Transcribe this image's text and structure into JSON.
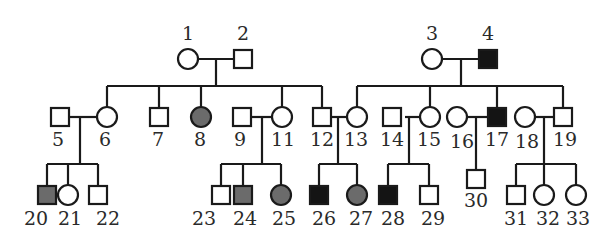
{
  "diagram": {
    "type": "pedigree",
    "colors": {
      "line": "#1a1a1a",
      "unaffected_fill": "#ffffff",
      "affected_dark": "#141414",
      "affected_gray": "#6b6b6b"
    },
    "individuals": [
      {
        "id": "1",
        "sex": "female",
        "status": "unaffected",
        "gen": 1
      },
      {
        "id": "2",
        "sex": "male",
        "status": "unaffected",
        "gen": 1
      },
      {
        "id": "3",
        "sex": "female",
        "status": "unaffected",
        "gen": 1
      },
      {
        "id": "4",
        "sex": "male",
        "status": "affected_dark",
        "gen": 1
      },
      {
        "id": "5",
        "sex": "male",
        "status": "unaffected",
        "gen": 2
      },
      {
        "id": "6",
        "sex": "female",
        "status": "unaffected",
        "gen": 2
      },
      {
        "id": "7",
        "sex": "male",
        "status": "unaffected",
        "gen": 2
      },
      {
        "id": "8",
        "sex": "female",
        "status": "affected_gray",
        "gen": 2
      },
      {
        "id": "9",
        "sex": "male",
        "status": "unaffected",
        "gen": 2
      },
      {
        "id": "11",
        "sex": "female",
        "status": "unaffected",
        "gen": 2
      },
      {
        "id": "12",
        "sex": "male",
        "status": "unaffected",
        "gen": 2
      },
      {
        "id": "13",
        "sex": "female",
        "status": "unaffected",
        "gen": 2
      },
      {
        "id": "14",
        "sex": "male",
        "status": "unaffected",
        "gen": 2
      },
      {
        "id": "15",
        "sex": "female",
        "status": "unaffected",
        "gen": 2
      },
      {
        "id": "16",
        "sex": "female",
        "status": "unaffected",
        "gen": 2
      },
      {
        "id": "17",
        "sex": "male",
        "status": "affected_dark",
        "gen": 2
      },
      {
        "id": "18",
        "sex": "female",
        "status": "unaffected",
        "gen": 2
      },
      {
        "id": "19",
        "sex": "male",
        "status": "unaffected",
        "gen": 2
      },
      {
        "id": "20",
        "sex": "male",
        "status": "affected_gray",
        "gen": 3
      },
      {
        "id": "21",
        "sex": "female",
        "status": "unaffected",
        "gen": 3
      },
      {
        "id": "22",
        "sex": "male",
        "status": "unaffected",
        "gen": 3
      },
      {
        "id": "23",
        "sex": "male",
        "status": "unaffected",
        "gen": 3
      },
      {
        "id": "24",
        "sex": "male",
        "status": "affected_gray",
        "gen": 3
      },
      {
        "id": "25",
        "sex": "female",
        "status": "affected_gray",
        "gen": 3
      },
      {
        "id": "26",
        "sex": "male",
        "status": "affected_dark",
        "gen": 3
      },
      {
        "id": "27",
        "sex": "female",
        "status": "affected_gray",
        "gen": 3
      },
      {
        "id": "28",
        "sex": "male",
        "status": "affected_dark",
        "gen": 3
      },
      {
        "id": "29",
        "sex": "male",
        "status": "unaffected",
        "gen": 3
      },
      {
        "id": "30",
        "sex": "male",
        "status": "unaffected",
        "gen": 3
      },
      {
        "id": "31",
        "sex": "male",
        "status": "unaffected",
        "gen": 3
      },
      {
        "id": "32",
        "sex": "female",
        "status": "unaffected",
        "gen": 3
      },
      {
        "id": "33",
        "sex": "female",
        "status": "unaffected",
        "gen": 3
      }
    ],
    "matings": [
      {
        "partners": [
          "1",
          "2"
        ],
        "children": [
          "6",
          "7",
          "8",
          "11",
          "12"
        ]
      },
      {
        "partners": [
          "3",
          "4"
        ],
        "children": [
          "13",
          "15",
          "17",
          "19"
        ]
      },
      {
        "partners": [
          "5",
          "6"
        ],
        "children": [
          "20",
          "21",
          "22"
        ]
      },
      {
        "partners": [
          "9",
          "11"
        ],
        "children": [
          "23",
          "24",
          "25"
        ]
      },
      {
        "partners": [
          "12",
          "13"
        ],
        "children": [
          "26",
          "27"
        ]
      },
      {
        "partners": [
          "14",
          "15"
        ],
        "children": [
          "28",
          "29"
        ]
      },
      {
        "partners": [
          "16",
          "17"
        ],
        "children": [
          "30"
        ]
      },
      {
        "partners": [
          "18",
          "19"
        ],
        "children": [
          "31",
          "32",
          "33"
        ]
      }
    ],
    "labels": {
      "l1": "1",
      "l2": "2",
      "l3": "3",
      "l4": "4",
      "l5": "5",
      "l6": "6",
      "l7": "7",
      "l8": "8",
      "l9": "9",
      "l11": "11",
      "l12": "12",
      "l13": "13",
      "l14": "14",
      "l15": "15",
      "l16": "16",
      "l17": "17",
      "l18": "18",
      "l19": "19",
      "l20": "20",
      "l21": "21",
      "l22": "22",
      "l23": "23",
      "l24": "24",
      "l25": "25",
      "l26": "26",
      "l27": "27",
      "l28": "28",
      "l29": "29",
      "l30": "30",
      "l31": "31",
      "l32": "32",
      "l33": "33"
    }
  }
}
